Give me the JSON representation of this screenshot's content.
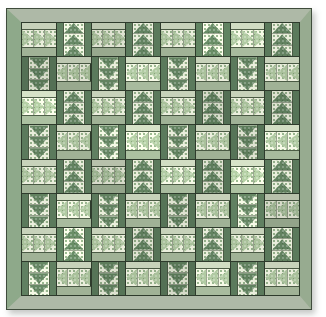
{
  "quilt": {
    "grid_rows": 8,
    "grid_cols": 8,
    "geese_per_block": 3,
    "blocks": [
      [
        "light-right",
        "dark-up",
        "light-right",
        "dark-up",
        "light-right",
        "dark-up",
        "light-right",
        "dark-up"
      ],
      [
        "dark-down",
        "light-left",
        "dark-down",
        "light-left",
        "dark-down",
        "light-left",
        "dark-down",
        "light-left"
      ],
      [
        "light-right",
        "dark-up",
        "light-right",
        "dark-up",
        "light-right",
        "dark-up",
        "light-right",
        "dark-up"
      ],
      [
        "dark-down",
        "light-left",
        "dark-down",
        "light-left",
        "dark-down",
        "light-left",
        "dark-down",
        "light-left"
      ],
      [
        "light-right",
        "dark-up",
        "light-right",
        "dark-up",
        "light-right",
        "dark-up",
        "light-right",
        "dark-up"
      ],
      [
        "dark-down",
        "light-left",
        "dark-down",
        "light-left",
        "dark-down",
        "light-left",
        "dark-down",
        "light-left"
      ],
      [
        "light-right",
        "dark-up",
        "light-right",
        "dark-up",
        "light-right",
        "dark-up",
        "light-right",
        "dark-up"
      ],
      [
        "dark-down",
        "light-left",
        "dark-down",
        "light-left",
        "dark-down",
        "light-left",
        "dark-down",
        "light-left"
      ]
    ],
    "colors": {
      "page_bg": "#ffffff",
      "border_outline": "#3f4c3c",
      "border_top": "#aeb9a7",
      "border_bottom": "#aeb9a7",
      "border_left": "#8ea98a",
      "border_right": "#97ab90",
      "seam": "#2e3b2c",
      "seam_soft": "#4a5a44",
      "light_strip_top": "#c7d2ba",
      "light_strip_bottom": "#a0b296",
      "light_goose": "#a9c19b",
      "dark_strip": "#5b7a5c",
      "dark_goose": "#628260",
      "print_bg": "#eaeedc",
      "print_speckle": "#90ac86",
      "print_speckle2": "#c3d2b4"
    }
  }
}
